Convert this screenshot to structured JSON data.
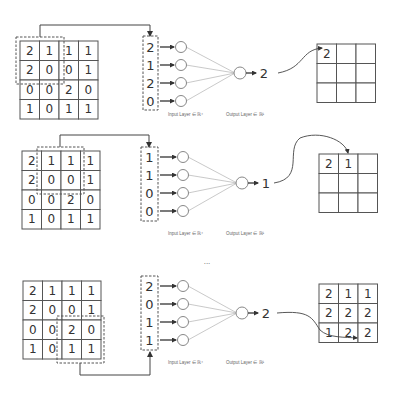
{
  "ellipsis": "...",
  "labels": {
    "input_layer": "Input Layer ∈ ℝ⁴",
    "output_layer": "Output Layer ∈ ℝ¹"
  },
  "input_matrix": [
    [
      2,
      1,
      1,
      1
    ],
    [
      2,
      0,
      0,
      1
    ],
    [
      0,
      0,
      2,
      0
    ],
    [
      1,
      0,
      1,
      1
    ]
  ],
  "steps": [
    {
      "name": "step-1",
      "matrix_origin": [
        20,
        41
      ],
      "window": {
        "row": 0,
        "col": 0
      },
      "window_box": [
        16,
        37,
        48,
        47
      ],
      "connector": {
        "points": [
          [
            40,
            37
          ],
          [
            40,
            25
          ],
          [
            150,
            25
          ],
          [
            150,
            36
          ]
        ]
      },
      "vector_box": [
        143,
        36,
        15,
        74
      ],
      "vector": [
        2,
        1,
        2,
        0
      ],
      "vector_y": [
        47,
        65,
        83,
        101
      ],
      "input_nodes_x": 181,
      "output_node": [
        240,
        73
      ],
      "output_value": "2",
      "output_value_x": 264,
      "labels_y": 114,
      "feature_map_origin": [
        317,
        44
      ],
      "feature_map": [
        [
          "2",
          "",
          ""
        ],
        [
          "",
          "",
          ""
        ],
        [
          "",
          "",
          ""
        ]
      ],
      "curve": "M 278 73 C 305 68, 300 50, 322 48"
    },
    {
      "name": "step-2",
      "matrix_origin": [
        22,
        151
      ],
      "window": {
        "row": 0,
        "col": 1
      },
      "window_box": [
        37,
        147,
        47,
        47
      ],
      "connector": {
        "points": [
          [
            60,
            147
          ],
          [
            60,
            135
          ],
          [
            149,
            135
          ],
          [
            149,
            147
          ]
        ]
      },
      "vector_box": [
        141,
        147,
        17,
        74
      ],
      "vector": [
        1,
        1,
        0,
        0
      ],
      "vector_y": [
        157,
        175,
        193,
        211
      ],
      "input_nodes_x": 183,
      "output_node": [
        242,
        183
      ],
      "output_value": "1",
      "output_value_x": 266,
      "labels_y": 233,
      "feature_map_origin": [
        319,
        154
      ],
      "feature_map": [
        [
          "2",
          "1",
          ""
        ],
        [
          "",
          "",
          ""
        ],
        [
          "",
          "",
          ""
        ]
      ],
      "curve": "M 274 183 C 305 178, 285 150, 300 138 C 320 130, 345 140, 348 153"
    },
    {
      "name": "step-9",
      "matrix_origin": [
        23,
        281
      ],
      "window": {
        "row": 2,
        "col": 2
      },
      "window_box": [
        57,
        316,
        47,
        47
      ],
      "connector": {
        "points": [
          [
            80,
            363
          ],
          [
            80,
            375
          ],
          [
            150,
            375
          ],
          [
            150,
            352
          ]
        ]
      },
      "vector_box": [
        141,
        276,
        17,
        74
      ],
      "vector": [
        2,
        0,
        1,
        1
      ],
      "vector_y": [
        286,
        304,
        322,
        340
      ],
      "input_nodes_x": 183,
      "output_node": [
        242,
        313
      ],
      "output_value": "2",
      "output_value_x": 266,
      "labels_y": 362,
      "feature_map_origin": [
        319,
        284
      ],
      "feature_map": [
        [
          "2",
          "1",
          "1"
        ],
        [
          "2",
          "2",
          "2"
        ],
        [
          "1",
          "2",
          "2"
        ]
      ],
      "curve": "M 277 313 C 310 310, 312 318, 320 330 C 328 338, 345 337, 357 338"
    }
  ]
}
